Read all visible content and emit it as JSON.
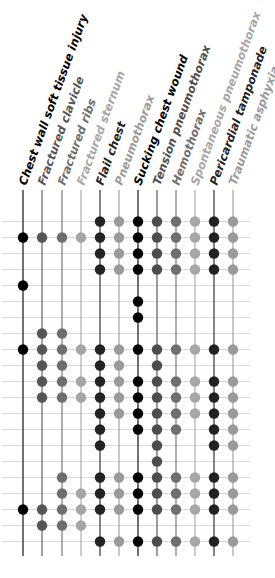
{
  "chart_data": {
    "type": "table",
    "title": "",
    "subtitle": "",
    "legend": "none",
    "grid": true,
    "columns": [
      {
        "label": "Chest wall soft tissue injury",
        "color": "#000000"
      },
      {
        "label": "Fractured clavicle",
        "color": "#555555"
      },
      {
        "label": "Fractured ribs",
        "color": "#6e6e6e"
      },
      {
        "label": "Fractured sternum",
        "color": "#a6a6a6"
      },
      {
        "label": "Flail chest",
        "color": "#222222"
      },
      {
        "label": "Pneumothorax",
        "color": "#9a9a9a"
      },
      {
        "label": "Sucking chest wound",
        "color": "#000000"
      },
      {
        "label": "Tension pneumothorax",
        "color": "#4d4d4d"
      },
      {
        "label": "Hemothorax",
        "color": "#6e6e6e"
      },
      {
        "label": "Spontaneous pneumothorax",
        "color": "#a6a6a6"
      },
      {
        "label": "Pericardial tamponade",
        "color": "#222222"
      },
      {
        "label": "Traumatic asphyxia",
        "color": "#9a9a9a"
      }
    ],
    "row_count": 21,
    "matrix": [
      [
        0,
        0,
        0,
        0,
        1,
        1,
        1,
        1,
        1,
        1,
        1,
        1
      ],
      [
        1,
        1,
        1,
        1,
        1,
        1,
        1,
        1,
        1,
        1,
        1,
        1
      ],
      [
        0,
        0,
        0,
        0,
        1,
        1,
        1,
        1,
        1,
        1,
        1,
        1
      ],
      [
        0,
        0,
        0,
        0,
        1,
        1,
        1,
        1,
        1,
        1,
        1,
        1
      ],
      [
        1,
        0,
        0,
        0,
        0,
        0,
        0,
        0,
        0,
        0,
        0,
        0
      ],
      [
        0,
        0,
        0,
        0,
        0,
        0,
        1,
        0,
        0,
        0,
        0,
        0
      ],
      [
        0,
        0,
        0,
        0,
        0,
        0,
        1,
        0,
        0,
        0,
        0,
        0
      ],
      [
        0,
        1,
        1,
        0,
        0,
        0,
        0,
        0,
        0,
        0,
        0,
        0
      ],
      [
        1,
        1,
        1,
        1,
        1,
        1,
        1,
        1,
        1,
        1,
        1,
        1
      ],
      [
        0,
        1,
        1,
        0,
        1,
        1,
        0,
        1,
        0,
        0,
        0,
        0
      ],
      [
        0,
        1,
        1,
        1,
        1,
        1,
        1,
        1,
        1,
        1,
        1,
        1
      ],
      [
        0,
        1,
        1,
        1,
        1,
        1,
        1,
        1,
        1,
        1,
        1,
        1
      ],
      [
        0,
        0,
        0,
        0,
        1,
        1,
        1,
        1,
        1,
        1,
        1,
        1
      ],
      [
        0,
        0,
        0,
        0,
        1,
        0,
        1,
        1,
        1,
        0,
        1,
        1
      ],
      [
        0,
        0,
        0,
        0,
        1,
        0,
        0,
        1,
        0,
        0,
        1,
        1
      ],
      [
        0,
        0,
        0,
        0,
        0,
        0,
        0,
        1,
        0,
        0,
        0,
        0
      ],
      [
        0,
        0,
        1,
        0,
        1,
        1,
        1,
        1,
        1,
        1,
        1,
        1
      ],
      [
        0,
        0,
        1,
        1,
        1,
        1,
        1,
        1,
        1,
        1,
        1,
        1
      ],
      [
        1,
        1,
        1,
        1,
        1,
        1,
        1,
        1,
        1,
        1,
        1,
        1
      ],
      [
        0,
        1,
        1,
        1,
        0,
        0,
        0,
        0,
        0,
        0,
        0,
        0
      ],
      [
        0,
        0,
        0,
        0,
        1,
        1,
        1,
        1,
        1,
        1,
        1,
        1
      ]
    ],
    "xlabel": "",
    "ylabel": ""
  },
  "layout": {
    "col_x": [
      23,
      42,
      62,
      81,
      100,
      119,
      138,
      157,
      176,
      195,
      214,
      233
    ],
    "row_y0": 221.5,
    "row_dy": 16,
    "line_top": 190,
    "line_bottom": 556,
    "grid_x0": 2,
    "grid_x1": 250,
    "dot_r": 5.2,
    "label_rotate": -70,
    "label_base_y": 186
  }
}
